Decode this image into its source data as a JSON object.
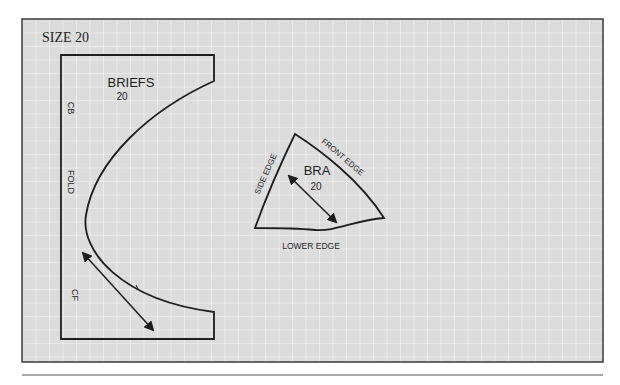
{
  "figure": {
    "size_label": "SIZE 20",
    "colors": {
      "grid_background": "#dcdcdc",
      "grid_line": "#f4f4f4",
      "outline": "#1e1e1e",
      "divider": "#8a8a8a"
    }
  },
  "pieces": {
    "briefs": {
      "title": "BRIEFS",
      "size": "20",
      "edge_labels": {
        "cb": "CB",
        "fold": "FOLD",
        "cf": "CF"
      },
      "notch": "notch mark",
      "grainline": "double-headed grainline arrow"
    },
    "bra": {
      "title": "BRA",
      "size": "20",
      "edge_labels": {
        "side": "SIDE EDGE",
        "front": "FRONT EDGE",
        "lower": "LOWER EDGE"
      },
      "grainline": "double-headed grainline arrow"
    }
  }
}
